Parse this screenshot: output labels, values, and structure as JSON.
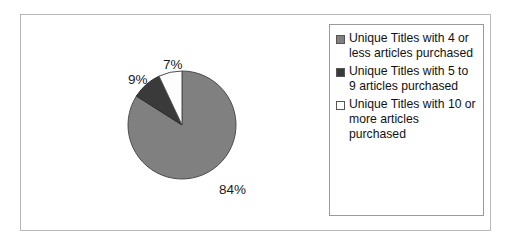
{
  "chart_data": {
    "type": "pie",
    "title": "",
    "categories": [
      "Unique Titles with 4 or less articles purchased",
      "Unique Titles with 5 to 9 articles purchased",
      "Unique Titles with 10 or more articles purchased"
    ],
    "values": [
      84,
      9,
      7
    ],
    "value_labels": [
      "84%",
      "9%",
      "7%"
    ],
    "colors": [
      "#808080",
      "#3a3a3a",
      "#fdfdfd"
    ],
    "legend_position": "right",
    "grid": false,
    "start_angle_deg": 0,
    "direction": "clockwise"
  },
  "figure": {
    "frame_border_color": "#b8b8b8",
    "background": "#ffffff"
  },
  "pie": {
    "slices": [
      {
        "name": "4-or-less",
        "label": "84%",
        "value": 84,
        "color": "#808080"
      },
      {
        "name": "5-to-9",
        "label": "9%",
        "value": 9,
        "color": "#3a3a3a"
      },
      {
        "name": "10-or-more",
        "label": "7%",
        "value": 7,
        "color": "#fdfdfd"
      }
    ]
  },
  "legend": {
    "border_color": "#9a9a9a",
    "items": [
      {
        "swatch_color": "#808080",
        "label": "Unique Titles with 4 or less articles purchased"
      },
      {
        "swatch_color": "#3a3a3a",
        "label": "Unique Titles with 5 to 9 articles purchased"
      },
      {
        "swatch_color": "#ffffff",
        "label": "Unique Titles with 10 or more articles purchased"
      }
    ]
  }
}
